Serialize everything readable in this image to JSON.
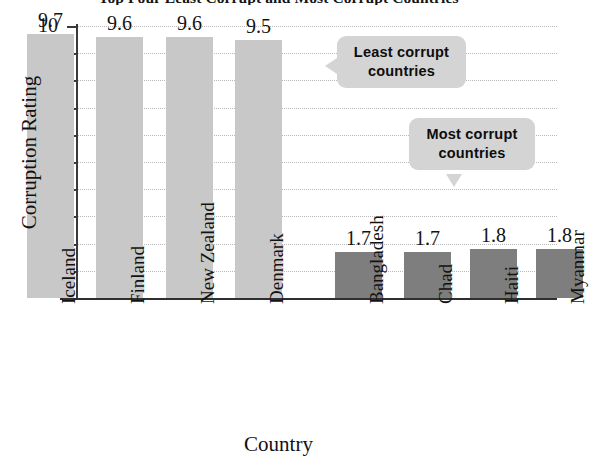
{
  "chart_data": {
    "type": "bar",
    "title": "Top Four Least Corrupt and Most Corrupt Countries",
    "xlabel": "Country",
    "ylabel": "Corruption Rating",
    "ylim": [
      0,
      10
    ],
    "ytick_labels": [
      "1",
      "2",
      "3",
      "4",
      "5",
      "6",
      "7",
      "8",
      "9",
      "10"
    ],
    "grid": true,
    "legend_position": "none",
    "categories": [
      "Iceland",
      "Finland",
      "New Zealand",
      "Denmark",
      "Bangladesh",
      "Chad",
      "Haiti",
      "Myanmar"
    ],
    "values": [
      9.7,
      9.6,
      9.6,
      9.5,
      1.7,
      1.7,
      1.8,
      1.8
    ],
    "value_labels": [
      "9.7",
      "9.6",
      "9.6",
      "9.5",
      "1.7",
      "1.7",
      "1.8",
      "1.8"
    ],
    "bar_colors": [
      "#c8c8c8",
      "#c8c8c8",
      "#c8c8c8",
      "#c8c8c8",
      "#7e7e7e",
      "#7e7e7e",
      "#7e7e7e",
      "#7e7e7e"
    ],
    "annotations": [
      {
        "line1": "Least corrupt",
        "line2": "countries",
        "tail": "left"
      },
      {
        "line1": "Most corrupt",
        "line2": "countries",
        "tail": "down"
      }
    ]
  },
  "colors": {
    "least_corrupt_bar": "#c8c8c8",
    "most_corrupt_bar": "#7e7e7e",
    "callout_bg": "#d4d4d4",
    "axis": "#2f2f2f",
    "gridline": "#b9b9b9",
    "background": "#ffffff"
  }
}
